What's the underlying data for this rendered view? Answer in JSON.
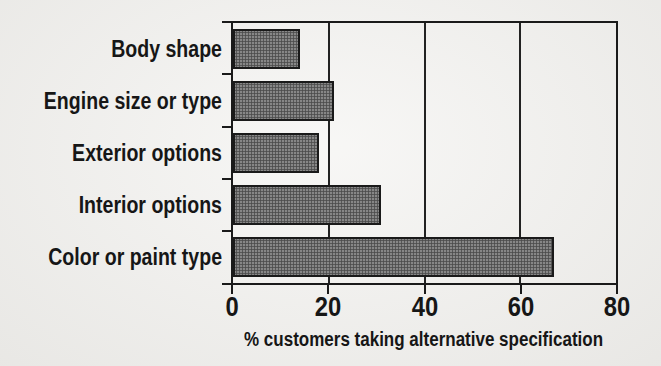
{
  "figure": {
    "background": "#f0efec",
    "axis_color": "#1a1a1a",
    "text_color": "#161616",
    "bar_fill": "#6f6f6f",
    "bar_border": "#1a1a1a"
  },
  "chart_data": {
    "type": "bar",
    "orientation": "horizontal",
    "title": "",
    "xlabel": "% customers taking alternative specification",
    "ylabel": "",
    "categories": [
      "Body shape",
      "Engine size or type",
      "Exterior options",
      "Interior options",
      "Color or paint type"
    ],
    "values": [
      14,
      21,
      18,
      31,
      67
    ],
    "xlim": [
      0,
      80
    ],
    "xticks": [
      "0",
      "20",
      "40",
      "60",
      "80"
    ],
    "gridlines_at": [
      20,
      40,
      60
    ],
    "grid": "vertical",
    "legend": "none"
  }
}
